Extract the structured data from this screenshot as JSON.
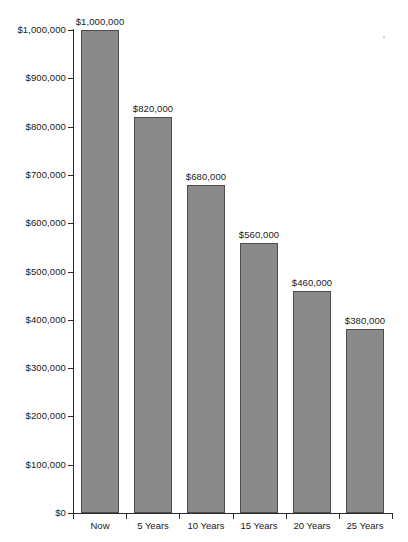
{
  "chart_data": {
    "type": "bar",
    "title": "",
    "subtitle": "",
    "xlabel": "",
    "ylabel": "",
    "categories": [
      "Now",
      "5 Years",
      "10 Years",
      "15 Years",
      "20 Years",
      "25 Years"
    ],
    "values": [
      1000000,
      820000,
      680000,
      560000,
      460000,
      380000
    ],
    "value_labels": [
      "$1,000,000",
      "$820,000",
      "$680,000",
      "$560,000",
      "$460,000",
      "$380,000"
    ],
    "ylim": [
      0,
      1000000
    ],
    "ytick_values": [
      0,
      100000,
      200000,
      300000,
      400000,
      500000,
      600000,
      700000,
      800000,
      900000,
      1000000
    ],
    "ytick_labels": [
      "$0",
      "$100,000",
      "$200,000",
      "$300,000",
      "$400,000",
      "$500,000",
      "$600,000",
      "$700,000",
      "$800,000",
      "$900,000",
      "$1,000,000"
    ],
    "grid": false,
    "legend": false,
    "legend_position": "none",
    "bar_fill_color": "#8a8a8a",
    "bar_border_color": "#4d4d4d",
    "axis_color": "#2b2b2b",
    "text_color": "#1a1a1a",
    "background_color": "#ffffff"
  }
}
